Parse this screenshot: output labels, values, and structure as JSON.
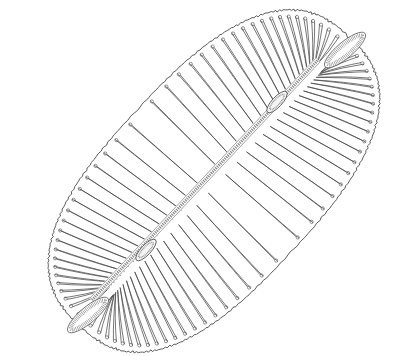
{
  "figure": {
    "background": "#ffffff",
    "line_color": "#4a4a4a",
    "stipple_color": "#8a8a8a",
    "valve": {
      "cx": 214,
      "cy": 181,
      "half_length": 196,
      "half_width": 104,
      "rotation_deg": -47,
      "striae_per_side": 40
    },
    "raphe": {
      "start": [
        92,
        300
      ],
      "end": [
        318,
        60
      ],
      "central_nodule": [
        205,
        180
      ],
      "polar_nodules": [
        [
          146,
          250
        ],
        [
          277,
          102
        ]
      ]
    },
    "stigmata_areas": [
      {
        "center": [
          88,
          315
        ],
        "length": 52,
        "width": 16,
        "angle_deg": -40
      },
      {
        "center": [
          345,
          50
        ],
        "length": 52,
        "width": 16,
        "angle_deg": -40
      }
    ]
  }
}
